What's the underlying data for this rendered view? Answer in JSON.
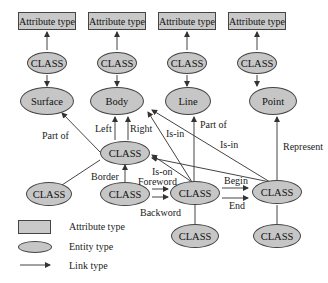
{
  "attribute_boxes": [
    {
      "label": "Attribute type"
    },
    {
      "label": "Attribute type"
    },
    {
      "label": "Attribute type"
    },
    {
      "label": "Attribute type"
    }
  ],
  "class_row": [
    {
      "label": "CLASS"
    },
    {
      "label": "CLASS"
    },
    {
      "label": "CLASS"
    },
    {
      "label": "CLASS"
    }
  ],
  "entities": [
    {
      "label": "Surface"
    },
    {
      "label": "Body"
    },
    {
      "label": "Line"
    },
    {
      "label": "Point"
    }
  ],
  "middle_class": {
    "label": "CLASS"
  },
  "lower_classes": {
    "left": "CLASS",
    "border": "CLASS",
    "center": "CLASS",
    "right": "CLASS",
    "bottom_center": "CLASS",
    "bottom_right": "CLASS"
  },
  "edge_labels": {
    "part_of_left": "Part of",
    "left": "Left",
    "right": "Right",
    "is_in_1": "Is-in",
    "part_of_line": "Part of",
    "is_in_2": "Is-in",
    "represent": "Represent",
    "border": "Border",
    "is_on": "Is-on",
    "foreword": "Foreword",
    "backword": "Backword",
    "begin": "Begin",
    "end": "End"
  },
  "legend": [
    {
      "shape": "rectangle",
      "label": "Attribute type"
    },
    {
      "shape": "ellipse",
      "label": "Entity type"
    },
    {
      "shape": "arrow",
      "label": "Link type"
    }
  ],
  "colors": {
    "fill": "#c6c6c6",
    "stroke": "#444444"
  }
}
